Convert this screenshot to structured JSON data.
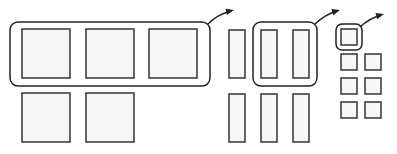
{
  "diagram": {
    "colors": {
      "stroke": "#222222",
      "cell_fill": "#f6f6f6",
      "background": "#ffffff"
    },
    "groups": [
      {
        "name": "large-squares",
        "cells": [
          {
            "x": 22,
            "y": 29,
            "w": 48,
            "h": 49
          },
          {
            "x": 86,
            "y": 29,
            "w": 48,
            "h": 49
          },
          {
            "x": 149,
            "y": 29,
            "w": 48,
            "h": 49
          },
          {
            "x": 22,
            "y": 93,
            "w": 48,
            "h": 49
          },
          {
            "x": 86,
            "y": 93,
            "w": 48,
            "h": 49
          }
        ],
        "highlight": {
          "x": 10,
          "y": 22,
          "w": 200,
          "h": 64,
          "r": 8
        },
        "arrow": {
          "from": [
            208,
            24
          ],
          "ctrl": [
            218,
            14
          ],
          "to": [
            234,
            10
          ]
        }
      },
      {
        "name": "tall-bars",
        "cells": [
          {
            "x": 229,
            "y": 30,
            "w": 16,
            "h": 48
          },
          {
            "x": 261,
            "y": 30,
            "w": 16,
            "h": 48
          },
          {
            "x": 293,
            "y": 30,
            "w": 16,
            "h": 48
          },
          {
            "x": 229,
            "y": 94,
            "w": 16,
            "h": 48
          },
          {
            "x": 261,
            "y": 94,
            "w": 16,
            "h": 48
          },
          {
            "x": 293,
            "y": 94,
            "w": 16,
            "h": 48
          }
        ],
        "highlight": {
          "x": 253,
          "y": 22,
          "w": 64,
          "h": 64,
          "r": 8
        },
        "arrow": {
          "from": [
            315,
            24
          ],
          "ctrl": [
            326,
            14
          ],
          "to": [
            340,
            10
          ]
        }
      },
      {
        "name": "small-squares",
        "cells": [
          {
            "x": 341,
            "y": 29,
            "w": 16,
            "h": 16
          },
          {
            "x": 341,
            "y": 54,
            "w": 16,
            "h": 16
          },
          {
            "x": 365,
            "y": 54,
            "w": 16,
            "h": 16
          },
          {
            "x": 341,
            "y": 78,
            "w": 16,
            "h": 16
          },
          {
            "x": 365,
            "y": 78,
            "w": 16,
            "h": 16
          },
          {
            "x": 341,
            "y": 102,
            "w": 16,
            "h": 16
          },
          {
            "x": 365,
            "y": 102,
            "w": 16,
            "h": 16
          }
        ],
        "highlight": {
          "x": 336,
          "y": 24,
          "w": 26,
          "h": 26,
          "r": 6
        },
        "arrow": {
          "from": [
            360,
            27
          ],
          "ctrl": [
            370,
            18
          ],
          "to": [
            384,
            14
          ]
        }
      }
    ]
  }
}
